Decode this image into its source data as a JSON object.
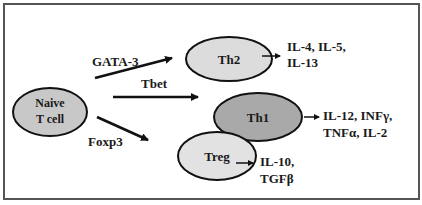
{
  "diagram": {
    "nodes": [
      {
        "id": "naive",
        "label_line1": "Naive",
        "label_line2": "T cell",
        "fill": "#c8c8c8"
      },
      {
        "id": "th2",
        "label": "Th2",
        "fill": "#dcdcdc"
      },
      {
        "id": "th1",
        "label": "Th1",
        "fill": "#a9a9a9"
      },
      {
        "id": "treg",
        "label": "Treg",
        "fill": "#e2e2e2"
      }
    ],
    "edges": [
      {
        "from": "naive",
        "to": "th2",
        "label": "GATA-3"
      },
      {
        "from": "naive",
        "to": "th1",
        "label": "Tbet"
      },
      {
        "from": "naive",
        "to": "treg",
        "label": "Foxp3"
      }
    ],
    "outputs": [
      {
        "from": "th2",
        "line1": "IL-4, IL-5,",
        "line2": "IL-13"
      },
      {
        "from": "th1",
        "line1": "IL-12, INFγ,",
        "line2": "TNFα, IL-2"
      },
      {
        "from": "treg",
        "line1": "IL-10,",
        "line2": "TGFβ"
      }
    ],
    "colors": {
      "stroke": "#111111",
      "frame": "#555555",
      "text": "#1a1a1a"
    }
  }
}
